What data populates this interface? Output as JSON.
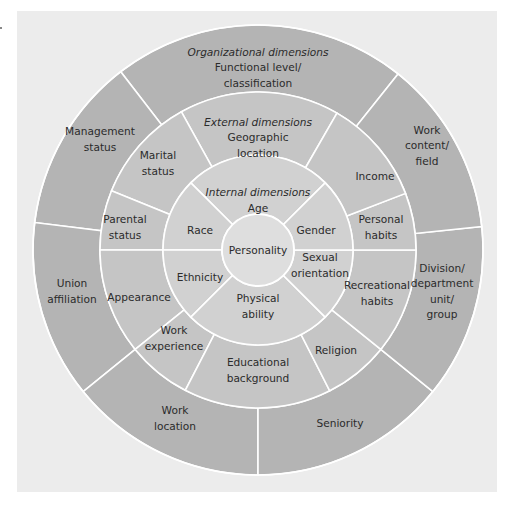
{
  "diagram": {
    "center": {
      "x": 258,
      "y": 250
    },
    "colors": {
      "background_panel": "#ececec",
      "outer_ring": "#b4b4b4",
      "middle_ring": "#c5c5c5",
      "inner_ring": "#d1d1d1",
      "core": "#dedede",
      "divider": "#ffffff",
      "text": "#2b2b2b"
    },
    "core": {
      "radius": 36,
      "label": "Personality"
    },
    "rings": [
      {
        "id": "internal",
        "heading": "Internal dimensions",
        "r_inner": 36,
        "r_outer": 95,
        "segments": [
          {
            "label": [
              "Age"
            ],
            "start": 45,
            "end": 135,
            "heading": true,
            "tx": 258,
            "ty": 200
          },
          {
            "label": [
              "Race"
            ],
            "start": 135,
            "end": 180,
            "tx": 200,
            "ty": 230
          },
          {
            "label": [
              "Ethnicity"
            ],
            "start": 180,
            "end": 225,
            "tx": 200,
            "ty": 277
          },
          {
            "label": [
              "Physical",
              "ability"
            ],
            "start": 225,
            "end": 315,
            "tx": 258,
            "ty": 306
          },
          {
            "label": [
              "Sexual",
              "orientation"
            ],
            "start": 315,
            "end": 360,
            "tx": 320,
            "ty": 265
          },
          {
            "label": [
              "Gender"
            ],
            "start": 0,
            "end": 45,
            "tx": 316,
            "ty": 230
          }
        ]
      },
      {
        "id": "external",
        "heading": "External dimensions",
        "r_inner": 95,
        "r_outer": 158,
        "segments": [
          {
            "label": [
              "Geographic",
              "location"
            ],
            "start": 60,
            "end": 119,
            "heading": true,
            "tx": 258,
            "ty": 137
          },
          {
            "label": [
              "Marital",
              "status"
            ],
            "start": 119,
            "end": 158,
            "tx": 158,
            "ty": 163
          },
          {
            "label": [
              "Parental",
              "status"
            ],
            "start": 158,
            "end": 180,
            "tx": 125,
            "ty": 227
          },
          {
            "label": [
              "Appearance"
            ],
            "start": 180,
            "end": 219,
            "tx": 139,
            "ty": 297
          },
          {
            "label": [
              "Work",
              "experience"
            ],
            "start": 219,
            "end": 242.6,
            "tx": 174,
            "ty": 338
          },
          {
            "label": [
              "Educational",
              "background"
            ],
            "start": 242.6,
            "end": 297,
            "tx": 258,
            "ty": 370
          },
          {
            "label": [
              "Religion"
            ],
            "start": 297,
            "end": 321,
            "tx": 336,
            "ty": 350
          },
          {
            "label": [
              "Recreational",
              "habits"
            ],
            "start": 321,
            "end": 360,
            "tx": 377,
            "ty": 293
          },
          {
            "label": [
              "Personal",
              "habits"
            ],
            "start": 0,
            "end": 21,
            "tx": 381,
            "ty": 227
          },
          {
            "label": [
              "Income"
            ],
            "start": 21,
            "end": 60,
            "tx": 375,
            "ty": 176
          }
        ]
      },
      {
        "id": "organizational",
        "heading": "Organizational dimensions",
        "r_inner": 158,
        "r_outer": 225,
        "segments": [
          {
            "label": [
              "Functional level/",
              "classification"
            ],
            "start": 51.5,
            "end": 127.6,
            "heading": true,
            "tx": 258,
            "ty": 67
          },
          {
            "label": [
              "Management",
              "status"
            ],
            "start": 127.6,
            "end": 173,
            "tx": 100,
            "ty": 139
          },
          {
            "label": [
              "Union",
              "affiliation"
            ],
            "start": 173,
            "end": 219,
            "tx": 72,
            "ty": 291
          },
          {
            "label": [
              "Work",
              "location"
            ],
            "start": 219,
            "end": 270,
            "tx": 175,
            "ty": 418
          },
          {
            "label": [
              "Seniority"
            ],
            "start": 270,
            "end": 321,
            "tx": 340,
            "ty": 423
          },
          {
            "label": [
              "Division/",
              "department",
              "unit/",
              "group"
            ],
            "start": 321,
            "end": 366,
            "tx": 442,
            "ty": 291
          },
          {
            "label": [
              "Work",
              "content/",
              "field"
            ],
            "start": 6,
            "end": 51.5,
            "tx": 427,
            "ty": 145
          }
        ]
      }
    ]
  }
}
